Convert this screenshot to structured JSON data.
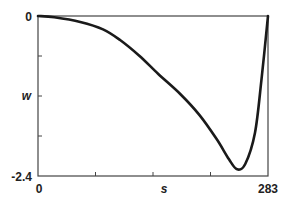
{
  "chart_data": {
    "type": "line",
    "title": "",
    "xlabel": "s",
    "ylabel": "w",
    "xlim": [
      0,
      283
    ],
    "ylim": [
      -2.4,
      0
    ],
    "x_tick_labels": [
      "0",
      "283"
    ],
    "y_tick_labels": [
      "0",
      "-2.4"
    ],
    "x_ticks": [
      0,
      70.75,
      141.5,
      212.25,
      283
    ],
    "y_ticks": [
      0,
      -0.6,
      -1.2,
      -1.8,
      -2.4
    ],
    "grid": false,
    "legend": null,
    "series": [
      {
        "name": "w(s)",
        "x": [
          0,
          20,
          52,
          80,
          101,
          125,
          148,
          175,
          199,
          220,
          235,
          245,
          255,
          267,
          275,
          283
        ],
        "y": [
          0,
          -0.02,
          -0.09,
          -0.2,
          -0.36,
          -0.6,
          -0.87,
          -1.17,
          -1.49,
          -1.85,
          -2.15,
          -2.3,
          -2.22,
          -1.75,
          -0.95,
          0
        ]
      }
    ]
  },
  "labels": {
    "y_top": "0",
    "y_bottom": "-2.4",
    "x_left": "0",
    "x_right": "283",
    "x_axis": "s",
    "y_axis": "w"
  }
}
